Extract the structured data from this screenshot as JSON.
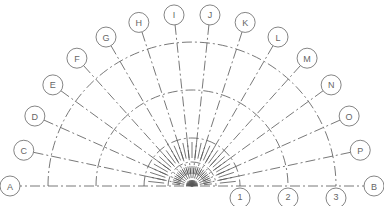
{
  "diagram": {
    "type": "radial-grid-plan",
    "center": {
      "x": 192,
      "y": 186
    },
    "radial_grids": [
      {
        "label": "A",
        "angle_deg": 180
      },
      {
        "label": "C",
        "angle_deg": 168
      },
      {
        "label": "D",
        "angle_deg": 156
      },
      {
        "label": "E",
        "angle_deg": 144
      },
      {
        "label": "F",
        "angle_deg": 132
      },
      {
        "label": "G",
        "angle_deg": 120
      },
      {
        "label": "H",
        "angle_deg": 108
      },
      {
        "label": "I",
        "angle_deg": 96
      },
      {
        "label": "J",
        "angle_deg": 84
      },
      {
        "label": "K",
        "angle_deg": 72
      },
      {
        "label": "L",
        "angle_deg": 60
      },
      {
        "label": "M",
        "angle_deg": 48
      },
      {
        "label": "N",
        "angle_deg": 36
      },
      {
        "label": "O",
        "angle_deg": 24
      },
      {
        "label": "P",
        "angle_deg": 12
      },
      {
        "label": "B",
        "angle_deg": 0
      }
    ],
    "arc_grids": [
      {
        "label": "1",
        "radius": 48
      },
      {
        "label": "2",
        "radius": 96
      },
      {
        "label": "3",
        "radius": 144
      }
    ],
    "bubble_radius": 10,
    "line_color": "#555555",
    "bubble_color": "#666666"
  }
}
